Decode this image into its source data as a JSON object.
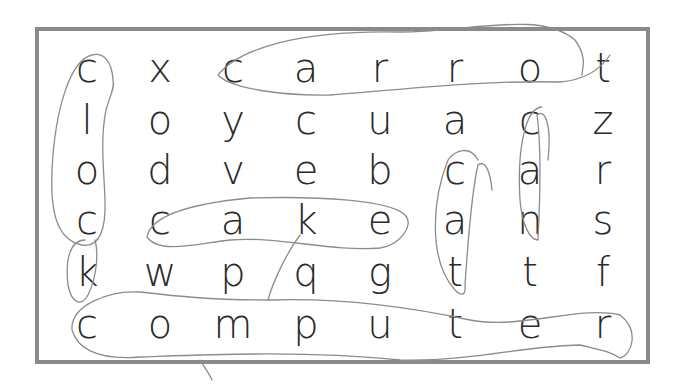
{
  "puzzle": {
    "type": "word-search",
    "rows": 6,
    "cols": 8,
    "grid": [
      [
        "c",
        "x",
        "c",
        "a",
        "r",
        "r",
        "o",
        "t"
      ],
      [
        "l",
        "o",
        "y",
        "c",
        "u",
        "a",
        "c",
        "z"
      ],
      [
        "o",
        "d",
        "v",
        "e",
        "b",
        "c",
        "a",
        "r"
      ],
      [
        "c",
        "c",
        "a",
        "k",
        "e",
        "a",
        "n",
        "s"
      ],
      [
        "k",
        "w",
        "p",
        "q",
        "g",
        "t",
        "t",
        "f"
      ],
      [
        "c",
        "o",
        "m",
        "p",
        "u",
        "t",
        "e",
        "r"
      ]
    ],
    "circled_words": [
      {
        "word": "clock",
        "direction": "vertical",
        "start": [
          0,
          0
        ],
        "end": [
          4,
          0
        ]
      },
      {
        "word": "carrot",
        "direction": "horizontal",
        "start": [
          0,
          2
        ],
        "end": [
          0,
          7
        ]
      },
      {
        "word": "cake",
        "direction": "horizontal",
        "start": [
          3,
          1
        ],
        "end": [
          3,
          4
        ]
      },
      {
        "word": "cat",
        "direction": "vertical",
        "start": [
          2,
          5
        ],
        "end": [
          4,
          5
        ]
      },
      {
        "word": "can",
        "direction": "vertical",
        "start": [
          1,
          6
        ],
        "end": [
          3,
          6
        ]
      },
      {
        "word": "computer",
        "direction": "horizontal",
        "start": [
          5,
          0
        ],
        "end": [
          5,
          7
        ]
      }
    ]
  },
  "colors": {
    "border": "#8a8a8a",
    "letters": "#2a2a2a",
    "pencil": "#8c8c8c",
    "background": "#ffffff"
  }
}
